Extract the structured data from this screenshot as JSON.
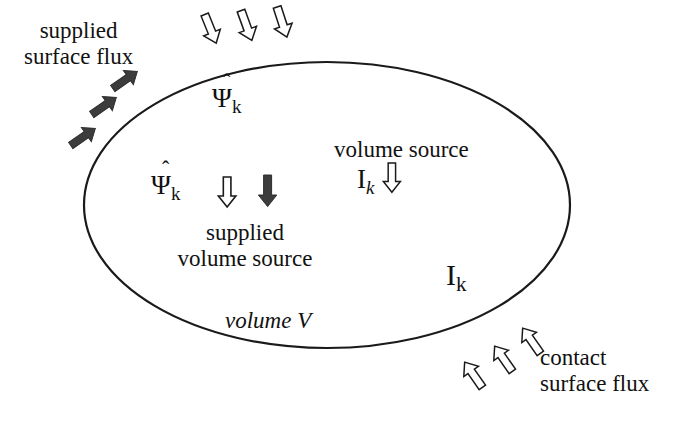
{
  "diagram": {
    "background_color": "#ffffff",
    "stroke_color": "#1a1a1a",
    "fill_dark_color": "#3a3a3a",
    "fill_hollow_color": "#ffffff",
    "boundary": {
      "shape_name": "volume-boundary-ellipse",
      "center_x": 327,
      "center_y": 205,
      "radius_x": 243,
      "radius_y": 143,
      "stroke_width": 2.2
    },
    "labels": {
      "supplied_surface_flux_line1": "supplied",
      "supplied_surface_flux_line2": "surface flux",
      "volume_source": "volume source",
      "supplied_volume_source_line1": "supplied",
      "supplied_volume_source_line2": "volume source",
      "volume_v": "volume V",
      "contact_surface_flux_line1": "contact",
      "contact_surface_flux_line2": "surface flux"
    },
    "symbols": {
      "psi_hat_top": {
        "base": "Ψ",
        "hat": "ˆ",
        "subscript": "k",
        "subscript_italic": false
      },
      "psi_hat_mid": {
        "base": "Ψ",
        "hat": "ˆ",
        "subscript": "k",
        "subscript_italic": false
      },
      "i_k_italic": {
        "base": "I",
        "subscript": "k",
        "subscript_italic": true
      },
      "i_k_upright": {
        "base": "I",
        "subscript": "k",
        "subscript_italic": false
      }
    },
    "arrow_groups": [
      {
        "group_name": "supplied-surface-flux-hollow-arrows",
        "style": "hollow",
        "direction_degrees": 160,
        "count": 3,
        "description": "hollow arrows entering top boundary pointing down-right"
      },
      {
        "group_name": "supplied-surface-flux-solid-arrows",
        "style": "solid",
        "direction_degrees": 145,
        "count": 3,
        "description": "solid dark arrows entering left boundary pointing down-right"
      },
      {
        "group_name": "supplied-volume-source-arrows",
        "style": "mixed",
        "direction_degrees": 180,
        "count": 2,
        "description": "one hollow and one solid downward arrow inside volume"
      },
      {
        "group_name": "volume-source-arrow",
        "style": "hollow",
        "direction_degrees": 180,
        "count": 1,
        "description": "hollow downward arrow inside volume at right"
      },
      {
        "group_name": "contact-surface-flux-arrows",
        "style": "hollow",
        "direction_degrees": 35,
        "count": 3,
        "description": "hollow arrows entering lower-right boundary pointing up-left"
      }
    ]
  }
}
